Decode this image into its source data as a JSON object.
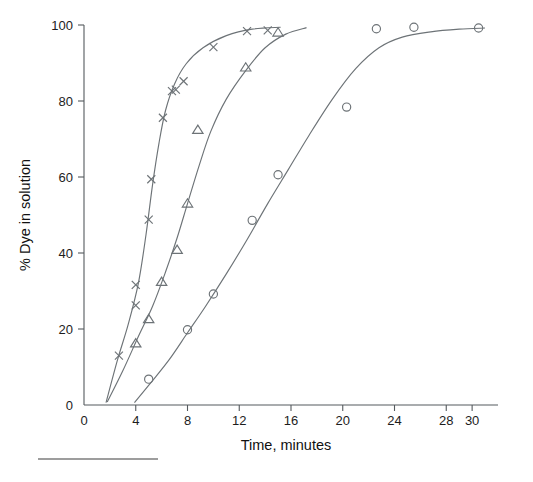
{
  "chart_data": {
    "type": "scatter",
    "title": "",
    "subtitle": "",
    "xlabel": "Time, minutes",
    "ylabel": "% Dye in solution",
    "xlim": [
      0,
      32
    ],
    "ylim": [
      0,
      100
    ],
    "xticks": [
      0,
      4,
      8,
      12,
      16,
      20,
      24,
      28,
      30
    ],
    "xticklabels": [
      "0",
      "4",
      "8",
      "12",
      "16",
      "20",
      "24",
      "28",
      "30"
    ],
    "yticks": [
      0,
      20,
      40,
      60,
      80,
      100
    ],
    "yticklabels": [
      "0",
      "20",
      "40",
      "60",
      "80",
      "100"
    ],
    "grid": false,
    "legend": "none",
    "series": [
      {
        "name": "series-x",
        "marker": "x",
        "color": "#6d7377",
        "points": [
          {
            "x": 2.7,
            "y": 13.0
          },
          {
            "x": 4.0,
            "y": 26.2
          },
          {
            "x": 4.0,
            "y": 31.6
          },
          {
            "x": 5.0,
            "y": 48.8
          },
          {
            "x": 5.2,
            "y": 59.4
          },
          {
            "x": 6.1,
            "y": 75.6
          },
          {
            "x": 6.8,
            "y": 82.6
          },
          {
            "x": 7.1,
            "y": 83.0
          },
          {
            "x": 7.7,
            "y": 85.2
          },
          {
            "x": 10.0,
            "y": 94.2
          },
          {
            "x": 12.6,
            "y": 98.4
          },
          {
            "x": 14.2,
            "y": 98.6
          }
        ],
        "fit_curve": [
          {
            "x": 1.7,
            "y": 0.6
          },
          {
            "x": 2.6,
            "y": 12.0
          },
          {
            "x": 3.4,
            "y": 21.0
          },
          {
            "x": 4.2,
            "y": 32.0
          },
          {
            "x": 4.8,
            "y": 45.0
          },
          {
            "x": 5.3,
            "y": 58.0
          },
          {
            "x": 5.8,
            "y": 69.0
          },
          {
            "x": 6.3,
            "y": 77.5
          },
          {
            "x": 7.0,
            "y": 84.5
          },
          {
            "x": 7.9,
            "y": 89.8
          },
          {
            "x": 9.2,
            "y": 94.0
          },
          {
            "x": 11.0,
            "y": 97.2
          },
          {
            "x": 13.0,
            "y": 98.9
          },
          {
            "x": 15.2,
            "y": 99.4
          }
        ]
      },
      {
        "name": "series-triangle",
        "marker": "triangle",
        "color": "#6d7377",
        "points": [
          {
            "x": 4.0,
            "y": 16.2
          },
          {
            "x": 5.0,
            "y": 22.6
          },
          {
            "x": 6.0,
            "y": 32.4
          },
          {
            "x": 7.2,
            "y": 40.8
          },
          {
            "x": 8.0,
            "y": 53.0
          },
          {
            "x": 8.8,
            "y": 72.4
          },
          {
            "x": 12.5,
            "y": 88.8
          },
          {
            "x": 15.0,
            "y": 98.0
          }
        ],
        "fit_curve": [
          {
            "x": 1.8,
            "y": 0.8
          },
          {
            "x": 3.0,
            "y": 9.0
          },
          {
            "x": 4.2,
            "y": 18.0
          },
          {
            "x": 5.3,
            "y": 26.0
          },
          {
            "x": 6.3,
            "y": 35.0
          },
          {
            "x": 7.2,
            "y": 44.0
          },
          {
            "x": 8.0,
            "y": 53.0
          },
          {
            "x": 8.9,
            "y": 63.0
          },
          {
            "x": 9.8,
            "y": 72.0
          },
          {
            "x": 11.0,
            "y": 80.5
          },
          {
            "x": 12.5,
            "y": 88.0
          },
          {
            "x": 14.0,
            "y": 94.0
          },
          {
            "x": 15.6,
            "y": 97.6
          },
          {
            "x": 17.2,
            "y": 99.3
          }
        ]
      },
      {
        "name": "series-circle",
        "marker": "circle",
        "color": "#6d7377",
        "points": [
          {
            "x": 5.0,
            "y": 6.8
          },
          {
            "x": 8.0,
            "y": 19.8
          },
          {
            "x": 10.0,
            "y": 29.2
          },
          {
            "x": 13.0,
            "y": 48.6
          },
          {
            "x": 15.0,
            "y": 60.6
          },
          {
            "x": 20.3,
            "y": 78.4
          },
          {
            "x": 22.6,
            "y": 99.0
          },
          {
            "x": 25.5,
            "y": 99.4
          },
          {
            "x": 30.5,
            "y": 99.2
          }
        ],
        "fit_curve": [
          {
            "x": 3.9,
            "y": 0.6
          },
          {
            "x": 5.2,
            "y": 6.0
          },
          {
            "x": 6.6,
            "y": 12.0
          },
          {
            "x": 8.0,
            "y": 19.0
          },
          {
            "x": 9.4,
            "y": 26.0
          },
          {
            "x": 11.0,
            "y": 34.5
          },
          {
            "x": 12.6,
            "y": 43.5
          },
          {
            "x": 14.2,
            "y": 53.0
          },
          {
            "x": 15.8,
            "y": 62.0
          },
          {
            "x": 17.4,
            "y": 71.0
          },
          {
            "x": 19.2,
            "y": 80.5
          },
          {
            "x": 21.0,
            "y": 88.5
          },
          {
            "x": 22.8,
            "y": 94.0
          },
          {
            "x": 24.6,
            "y": 96.8
          },
          {
            "x": 26.8,
            "y": 98.2
          },
          {
            "x": 29.0,
            "y": 98.9
          },
          {
            "x": 31.0,
            "y": 99.2
          }
        ]
      }
    ]
  }
}
